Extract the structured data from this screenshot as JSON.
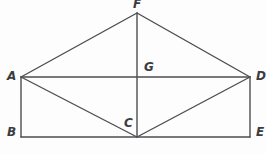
{
  "figure": {
    "background_color": "#fdfdfd",
    "line_color": "#4d4d52",
    "label_color": "#3b3b40",
    "line_width": 1.4,
    "width": 266,
    "height": 154
  },
  "labels": {
    "A": "A",
    "B": "B",
    "C": "C",
    "D": "D",
    "E": "E",
    "F": "F",
    "G": "G"
  },
  "chart_data": {
    "type": "scatter",
    "xlabel": "",
    "ylabel": "",
    "xlim": [
      0,
      266
    ],
    "ylim": [
      0,
      154
    ],
    "grid": false,
    "legend": null,
    "points": [
      {
        "name": "A",
        "x": 21,
        "y": 77
      },
      {
        "name": "B",
        "x": 21,
        "y": 137
      },
      {
        "name": "C",
        "x": 137,
        "y": 137
      },
      {
        "name": "D",
        "x": 250,
        "y": 77
      },
      {
        "name": "E",
        "x": 250,
        "y": 137
      },
      {
        "name": "F",
        "x": 137,
        "y": 13
      },
      {
        "name": "G",
        "x": 137,
        "y": 77
      }
    ],
    "segments": [
      {
        "name": "A-F",
        "from": "A",
        "to": "F"
      },
      {
        "name": "F-D",
        "from": "F",
        "to": "D"
      },
      {
        "name": "F-C",
        "from": "F",
        "to": "C"
      },
      {
        "name": "A-D",
        "from": "A",
        "to": "D"
      },
      {
        "name": "A-B",
        "from": "A",
        "to": "B"
      },
      {
        "name": "B-E",
        "from": "B",
        "to": "E"
      },
      {
        "name": "D-E",
        "from": "D",
        "to": "E"
      },
      {
        "name": "A-C",
        "from": "A",
        "to": "C"
      },
      {
        "name": "C-D",
        "from": "C",
        "to": "D"
      }
    ],
    "label_positions": [
      {
        "name": "A",
        "x": 7,
        "y": 70
      },
      {
        "name": "B",
        "x": 7,
        "y": 126
      },
      {
        "name": "C",
        "x": 124,
        "y": 117
      },
      {
        "name": "D",
        "x": 256,
        "y": 70
      },
      {
        "name": "E",
        "x": 256,
        "y": 126
      },
      {
        "name": "F",
        "x": 133,
        "y": -2
      },
      {
        "name": "G",
        "x": 144,
        "y": 61
      }
    ]
  }
}
